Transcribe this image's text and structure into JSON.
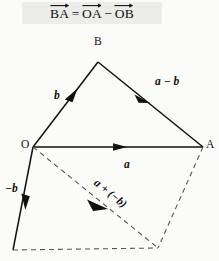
{
  "figure": {
    "title_equation": {
      "lhs_vector": "BA",
      "equals": "=",
      "term1_vector": "OA",
      "operator": "−",
      "term2_vector": "OB",
      "plain_text": "BA⃗ = OA⃗ − OB⃗"
    },
    "background_color": "#fbfbfa",
    "equation_box_color": "#ececeb",
    "stroke_color": "#111111",
    "dashed_color": "#555555",
    "vertices": [
      {
        "name": "O",
        "label": "O",
        "x": 33,
        "y": 147,
        "label_x": 21,
        "label_y": 140
      },
      {
        "name": "A",
        "label": "A",
        "x": 203,
        "y": 147,
        "label_x": 206,
        "label_y": 140
      },
      {
        "name": "B",
        "label": "B",
        "x": 98,
        "y": 62,
        "label_x": 94,
        "label_y": 36
      }
    ],
    "labels": {
      "b": "b",
      "a": "a",
      "a_minus_b": "a − b",
      "minus_b": "−b",
      "a_plus_minus_b": "a + (−b)"
    },
    "vectors": [
      {
        "name": "OB",
        "label": "b",
        "style": "solid",
        "from": "O",
        "to": "B",
        "arrow": "mid"
      },
      {
        "name": "OA",
        "label": "a",
        "style": "solid",
        "from": "O",
        "to": "A",
        "arrow": "mid"
      },
      {
        "name": "BA",
        "label": "a − b",
        "style": "solid",
        "from": "B",
        "to": "A",
        "arrow": "mid"
      },
      {
        "name": "O-minusB",
        "label": "−b",
        "style": "solid",
        "from": "O",
        "to": "D",
        "arrow": "mid"
      },
      {
        "name": "resultant",
        "label": "a + (−b)",
        "style": "dashed",
        "from": "O",
        "to": "C",
        "arrow": "mid"
      },
      {
        "name": "A-to-C",
        "label": "",
        "style": "dashed",
        "from": "A",
        "to": "C",
        "arrow": "none"
      },
      {
        "name": "D-to-C",
        "label": "",
        "style": "dashed",
        "from": "D",
        "to": "C",
        "arrow": "none"
      }
    ]
  }
}
